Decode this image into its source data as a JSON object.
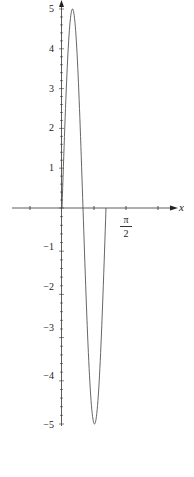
{
  "chart_data": {
    "type": "line",
    "title": "",
    "xlabel": "x",
    "ylabel": "",
    "x_tick_labels": [
      {
        "value": 1.5708,
        "label": "π/2"
      }
    ],
    "y_tick_labels": [
      "5",
      "4",
      "3",
      "2",
      "1",
      "−1",
      "−2",
      "−3",
      "−4",
      "−5"
    ],
    "ylim": [
      -5,
      5
    ],
    "xlim": [
      -0.75,
      2.5
    ],
    "grid": false,
    "series": [
      {
        "name": "f(x)",
        "x": [
          0,
          0.13,
          0.26,
          0.39,
          0.52,
          0.65,
          0.785,
          0.92,
          1.05
        ],
        "y": [
          0,
          3.5,
          5,
          3.5,
          0,
          -3.5,
          -5,
          -3.5,
          0
        ]
      }
    ],
    "colors": {
      "axis": "#333333",
      "curve": "#555555"
    }
  },
  "labels": {
    "x_axis": "x",
    "pi": "π",
    "two": "2",
    "y5": "5",
    "y4": "4",
    "y3": "3",
    "y2": "2",
    "y1": "1",
    "yn1": "−1",
    "yn2": "−2",
    "yn3": "−3",
    "yn4": "−4",
    "yn5": "−5"
  }
}
